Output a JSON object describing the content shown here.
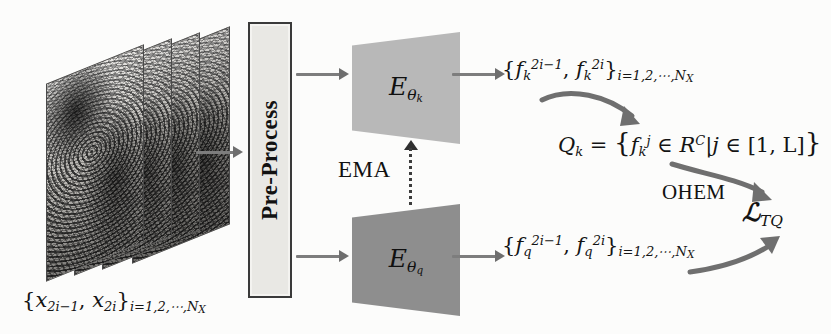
{
  "figure": {
    "type": "architecture-diagram",
    "background_color": "#fcfcfb",
    "domain": "self-supervised fingerprint representation learning pipeline"
  },
  "input": {
    "stack_name": "fingerprint-image-stack",
    "sheet_count": 4,
    "caption": "{x",
    "caption_parts": {
      "open": "{",
      "term1_base": "x",
      "term1_sub": "2i−1",
      "comma": ", ",
      "term2_base": "x",
      "term2_sub": "2i",
      "close": "}",
      "range_sub": "i=1,2,⋯,N"
    },
    "range_tail": "X"
  },
  "preprocess": {
    "label": "Pre-Process",
    "fill_color": "#e9e8e4",
    "border_color": "#3a3a3a"
  },
  "encoders": [
    {
      "id": "encoder-key",
      "symbol_base": "E",
      "symbol_sub": "θ",
      "symbol_sub_sub": "k",
      "fill_color": "#b8b8b8",
      "position": "top"
    },
    {
      "id": "encoder-query",
      "symbol_base": "E",
      "symbol_sub": "θ",
      "symbol_sub_sub": "q",
      "fill_color": "#8e8e8e",
      "position": "bottom"
    }
  ],
  "ema": {
    "label": "EMA",
    "line_style": "dotted",
    "direction": "upward",
    "from": "encoder-query",
    "to": "encoder-key",
    "color": "#2f2f2f"
  },
  "features": {
    "key_set": {
      "open": "{",
      "f_base": "f",
      "f_sub": "k",
      "sup1": "2i−1",
      "comma": ", ",
      "sup2": "2i",
      "close": "}",
      "range_sub": "i=1,2,⋯,N",
      "range_tail": "X"
    },
    "query_set": {
      "open": "{",
      "f_base": "f",
      "f_sub": "q",
      "sup1": "2i−1",
      "comma": ", ",
      "sup2": "2i",
      "close": "}",
      "range_sub": "i=1,2,⋯,N",
      "range_tail": "X"
    }
  },
  "queue": {
    "name": "Q",
    "name_sub": "k",
    "equals": " = ",
    "open": "{",
    "f_base": "f",
    "f_sub": "k",
    "f_sup": "j",
    "in1": " ∈ ",
    "space_base": "R",
    "space_sup": "C",
    "bar": "|",
    "index": "j",
    "in2": " ∈ ",
    "interval": "[1, L]",
    "close": "}"
  },
  "ohem": {
    "label": "OHEM"
  },
  "loss": {
    "symbol": "ℒ",
    "subscript": "TQ"
  },
  "arrows": {
    "straight": [
      {
        "name": "arrow-input-to-preprocess"
      },
      {
        "name": "arrow-preprocess-to-encoder-key"
      },
      {
        "name": "arrow-preprocess-to-encoder-query"
      },
      {
        "name": "arrow-encoder-key-to-features"
      },
      {
        "name": "arrow-encoder-query-to-features"
      }
    ],
    "curved": [
      {
        "name": "arrow-key-features-to-queue"
      },
      {
        "name": "arrow-queue-to-loss"
      },
      {
        "name": "arrow-query-features-to-loss"
      }
    ],
    "color": "#7d7d7d"
  }
}
